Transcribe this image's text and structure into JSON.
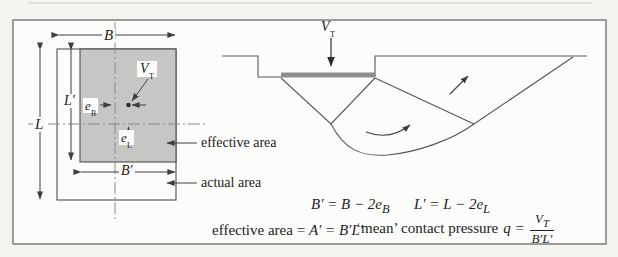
{
  "figure": {
    "plan": {
      "dim_B": "B",
      "dim_L": "L",
      "dim_L_prime": "L′",
      "dim_B_prime": "B′",
      "ecc_b": {
        "base": "e",
        "sub": "B"
      },
      "ecc_l": {
        "base": "e",
        "sub": "L"
      },
      "load": {
        "base": "V",
        "sub": "T"
      },
      "effective_area_label": "effective area",
      "actual_area_label": "actual area"
    },
    "section": {
      "load": {
        "base": "V",
        "sub": "T"
      }
    },
    "equations": {
      "width": {
        "expr": "B′ = B − 2e",
        "sub": "B"
      },
      "length": {
        "expr": "L′ = L − 2e",
        "sub": "L"
      },
      "area": {
        "label": "effective area = ",
        "expr": "A′ = B′L′"
      },
      "pressure": {
        "label": "‘mean’ contact pressure ",
        "expr": "q =",
        "num": {
          "base": "V",
          "sub": "T"
        },
        "den": "B′L′"
      }
    },
    "colors": {
      "effective_fill": "#c6c6c4",
      "footing_fill": "#8d8d8d",
      "line": "#4f4f4f",
      "centerline": "#8a8a8a",
      "text": "#1c1c1c",
      "frame": "#7d7d7d"
    }
  }
}
